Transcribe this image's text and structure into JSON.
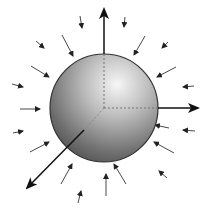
{
  "diagram": {
    "title": "",
    "sphere": {
      "cx": 104,
      "cy": 108,
      "r": 54,
      "highlight_color": "#f4f4f4",
      "shadow_color": "#4a4a4a",
      "outline_color": "#333333"
    },
    "axes": [
      {
        "name": "z-axis",
        "x1": 104,
        "y1": 108,
        "x2": 104,
        "y2": 8,
        "inside_dashed": true
      },
      {
        "name": "x-axis",
        "x1": 104,
        "y1": 108,
        "x2": 198,
        "y2": 108,
        "inside_dashed": true
      },
      {
        "name": "y-axis",
        "x1": 84,
        "y1": 130,
        "x2": 26,
        "y2": 188,
        "inside_dashed": true
      }
    ],
    "field_arrows": [
      {
        "x1": 80,
        "y1": 16,
        "x2": 82,
        "y2": 28
      },
      {
        "x1": 62,
        "y1": 35,
        "x2": 73,
        "y2": 56
      },
      {
        "x1": 36,
        "y1": 41,
        "x2": 44,
        "y2": 48
      },
      {
        "x1": 31,
        "y1": 66,
        "x2": 49,
        "y2": 77
      },
      {
        "x1": 12,
        "y1": 84,
        "x2": 23,
        "y2": 87
      },
      {
        "x1": 20,
        "y1": 109,
        "x2": 40,
        "y2": 109
      },
      {
        "x1": 13,
        "y1": 133,
        "x2": 23,
        "y2": 131
      },
      {
        "x1": 30,
        "y1": 152,
        "x2": 49,
        "y2": 142
      },
      {
        "x1": 61,
        "y1": 184,
        "x2": 72,
        "y2": 164
      },
      {
        "x1": 78,
        "y1": 203,
        "x2": 81,
        "y2": 191
      },
      {
        "x1": 106,
        "y1": 196,
        "x2": 106,
        "y2": 174
      },
      {
        "x1": 126,
        "y1": 184,
        "x2": 114,
        "y2": 164
      },
      {
        "x1": 169,
        "y1": 128,
        "x2": 155,
        "y2": 125
      },
      {
        "x1": 174,
        "y1": 153,
        "x2": 154,
        "y2": 142
      },
      {
        "x1": 167,
        "y1": 178,
        "x2": 159,
        "y2": 171
      },
      {
        "x1": 125,
        "y1": 17,
        "x2": 124,
        "y2": 27
      },
      {
        "x1": 145,
        "y1": 36,
        "x2": 134,
        "y2": 55
      },
      {
        "x1": 168,
        "y1": 42,
        "x2": 162,
        "y2": 48
      },
      {
        "x1": 176,
        "y1": 67,
        "x2": 157,
        "y2": 77
      },
      {
        "x1": 194,
        "y1": 86,
        "x2": 183,
        "y2": 87
      },
      {
        "x1": 195,
        "y1": 131,
        "x2": 183,
        "y2": 130
      }
    ]
  }
}
